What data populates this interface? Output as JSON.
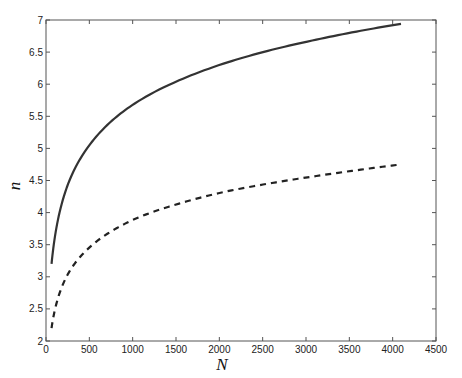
{
  "chart_data": {
    "type": "line",
    "title": "",
    "xlabel": "N",
    "ylabel": "n",
    "xlim": [
      0,
      4500
    ],
    "ylim": [
      2,
      7
    ],
    "xticks": [
      0,
      500,
      1000,
      1500,
      2000,
      2500,
      3000,
      3500,
      4000,
      4500
    ],
    "yticks": [
      2,
      2.5,
      3,
      3.5,
      4,
      4.5,
      5,
      5.5,
      6,
      6.5,
      7
    ],
    "xtick_labels": [
      "0",
      "500",
      "1000",
      "1500",
      "2000",
      "2500",
      "3000",
      "3500",
      "4000",
      "4500"
    ],
    "ytick_labels": [
      "2",
      "2.5",
      "3",
      "3.5",
      "4",
      "4.5",
      "5",
      "5.5",
      "6",
      "6.5",
      "7"
    ],
    "grid": false,
    "legend": null,
    "x": [
      64,
      128,
      256,
      512,
      768,
      1024,
      1536,
      2048,
      2560,
      3072,
      3584,
      4096
    ],
    "series": [
      {
        "name": "solid",
        "style": "solid",
        "color": "#333333",
        "values": [
          3.2,
          3.82,
          4.45,
          5.07,
          5.44,
          5.7,
          6.06,
          6.32,
          6.52,
          6.68,
          6.82,
          6.94
        ]
      },
      {
        "name": "dashed",
        "style": "dashed",
        "color": "#222222",
        "values": [
          2.2,
          2.62,
          3.05,
          3.47,
          3.72,
          3.9,
          4.14,
          4.32,
          4.45,
          4.56,
          4.66,
          4.75
        ]
      }
    ]
  }
}
